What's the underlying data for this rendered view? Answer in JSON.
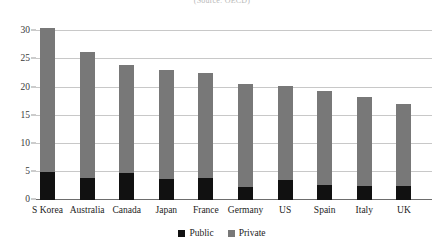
{
  "source_note": "(Source: OECD)",
  "legend": {
    "position": "bottom-center",
    "items": [
      {
        "label": "Public",
        "color": "#111111"
      },
      {
        "label": "Private",
        "color": "#787878"
      }
    ]
  },
  "chart_data": {
    "type": "bar",
    "subtype": "stacked-vertical",
    "title": "",
    "subtitle": "(Source: OECD)",
    "xlabel": "",
    "ylabel": "",
    "ylim": [
      0,
      32
    ],
    "yticks": [
      0,
      5,
      10,
      15,
      20,
      25,
      30
    ],
    "ytick_labels": [
      "0",
      "5",
      "10",
      "15",
      "20",
      "25",
      "30"
    ],
    "grid": true,
    "grid_axis": "y",
    "categories": [
      "S Korea",
      "Australia",
      "Canada",
      "Japan",
      "France",
      "Germany",
      "US",
      "Spain",
      "Italy",
      "UK"
    ],
    "series": [
      {
        "name": "Public",
        "color": "#111111",
        "values": [
          4.9,
          3.9,
          4.8,
          3.7,
          3.9,
          2.3,
          3.6,
          2.6,
          2.5,
          2.5
        ]
      },
      {
        "name": "Private",
        "color": "#787878",
        "values": [
          25.6,
          22.4,
          19.2,
          19.5,
          18.7,
          18.4,
          16.7,
          16.7,
          15.8,
          14.6
        ]
      }
    ],
    "totals": [
      30.5,
      26.3,
      24.0,
      23.2,
      22.6,
      20.7,
      20.3,
      19.3,
      18.3,
      17.1
    ]
  }
}
